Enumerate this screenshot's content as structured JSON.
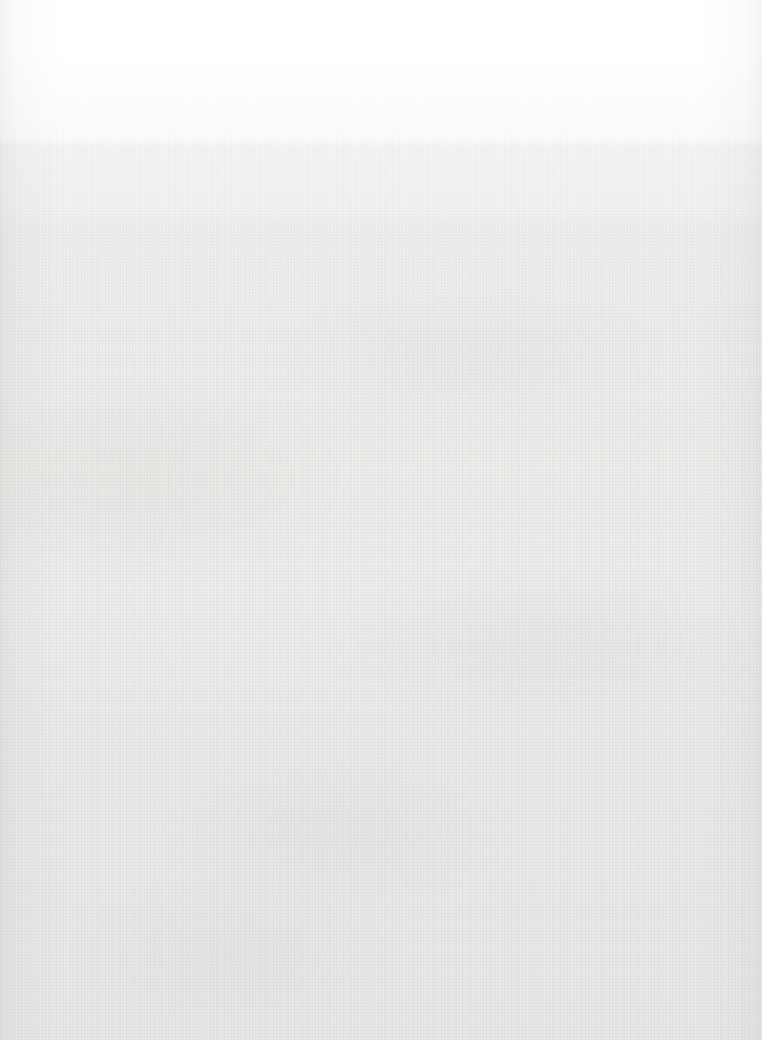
{
  "page": {
    "kind": "blank-page",
    "width": 762,
    "height": 1040,
    "orientation": "portrait",
    "has_text": false,
    "has_graphics": false,
    "content_text": "",
    "background": {
      "base_color": "#ffffff",
      "bottom_color": "#e8e9e7",
      "mid_color": "#edeeec",
      "gradient_direction": "top-to-bottom",
      "gradient_stops": [
        {
          "y": 0,
          "color": "#ffffff"
        },
        {
          "y": 48,
          "color": "#ffffff"
        },
        {
          "y": 95,
          "color": "#fdfdfd"
        },
        {
          "y": 140,
          "color": "#fbfbfa"
        },
        {
          "y": 146,
          "color": "#f4f5f3"
        },
        {
          "y": 210,
          "color": "#f2f3f1"
        },
        {
          "y": 226,
          "color": "#eeefed"
        },
        {
          "y": 330,
          "color": "#eceded"
        },
        {
          "y": 470,
          "color": "#ededeb"
        },
        {
          "y": 600,
          "color": "#eceded"
        },
        {
          "y": 740,
          "color": "#eaebe9"
        },
        {
          "y": 880,
          "color": "#e9eae8"
        },
        {
          "y": 1040,
          "color": "#e8e9e7"
        }
      ],
      "band_edges_y": [
        142,
        220
      ],
      "texture": {
        "style": "woven-paper-fiber",
        "thread_color": "#888a86",
        "visible_from_y": 120
      },
      "vignette": {
        "sides": "left-and-right",
        "color": "#aaaca8",
        "strength": 0.14
      }
    }
  }
}
